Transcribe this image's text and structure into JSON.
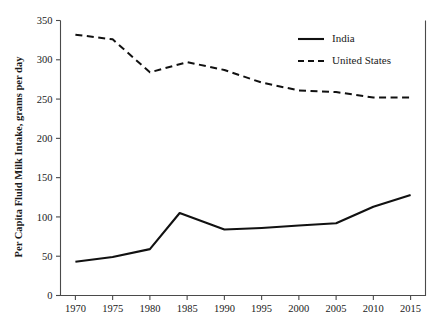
{
  "chart_data": {
    "type": "line",
    "title": "",
    "xlabel": "",
    "ylabel": "Per Capita Fluid Milk Intake, grams per day",
    "x": [
      1970,
      1975,
      1980,
      1984,
      1985,
      1990,
      1995,
      2000,
      2005,
      2010,
      2015
    ],
    "xlim": [
      1968,
      2017
    ],
    "ylim": [
      0,
      350
    ],
    "xticks": [
      1970,
      1975,
      1980,
      1985,
      1990,
      1995,
      2000,
      2005,
      2010,
      2015
    ],
    "xtick_labels": [
      "1970",
      "1975",
      "1980",
      "1985",
      "1990",
      "1995",
      "2000",
      "2005",
      "2010",
      "2015"
    ],
    "yticks": [
      0,
      50,
      100,
      150,
      200,
      250,
      300,
      350
    ],
    "ytick_labels": [
      "0",
      "50",
      "100",
      "150",
      "200",
      "250",
      "300",
      "350"
    ],
    "grid": false,
    "legend_position": "top-right",
    "series": [
      {
        "name": "India",
        "style": "solid",
        "color": "#111111",
        "points": [
          {
            "x": 1970,
            "y": 43
          },
          {
            "x": 1975,
            "y": 49
          },
          {
            "x": 1980,
            "y": 59
          },
          {
            "x": 1984,
            "y": 105
          },
          {
            "x": 1990,
            "y": 84
          },
          {
            "x": 1995,
            "y": 86
          },
          {
            "x": 2000,
            "y": 89
          },
          {
            "x": 2005,
            "y": 92
          },
          {
            "x": 2010,
            "y": 113
          },
          {
            "x": 2015,
            "y": 128
          }
        ]
      },
      {
        "name": "United States",
        "style": "dashed",
        "color": "#111111",
        "points": [
          {
            "x": 1970,
            "y": 332
          },
          {
            "x": 1975,
            "y": 326
          },
          {
            "x": 1980,
            "y": 284
          },
          {
            "x": 1985,
            "y": 297
          },
          {
            "x": 1990,
            "y": 287
          },
          {
            "x": 1995,
            "y": 271
          },
          {
            "x": 2000,
            "y": 261
          },
          {
            "x": 2005,
            "y": 259
          },
          {
            "x": 2010,
            "y": 252
          },
          {
            "x": 2015,
            "y": 252
          }
        ]
      }
    ],
    "legend": [
      {
        "label": "India",
        "style": "solid"
      },
      {
        "label": "United States",
        "style": "dashed"
      }
    ]
  }
}
